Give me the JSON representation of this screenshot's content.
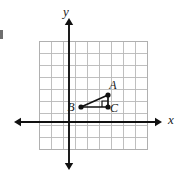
{
  "figure": {
    "background_color": "#ffffff",
    "width": 188,
    "height": 179
  },
  "axes": {
    "x_label": "x",
    "y_label": "y",
    "axis_color": "#111111",
    "origin_px": {
      "x": 69,
      "y": 122
    },
    "x_axis_span_px": {
      "from": 14,
      "to": 162
    },
    "y_axis_span_px": {
      "from": 18,
      "to": 170
    },
    "arrowheads": [
      "left",
      "right",
      "up",
      "down"
    ]
  },
  "grid": {
    "line_color": "#b8b8b8",
    "border_color": "#b0b0b0",
    "cell_size_px": 12.1,
    "left_px": 39,
    "top_px": 41,
    "columns": 9,
    "rows": 9,
    "visible": true
  },
  "triangle": {
    "name": "ABC",
    "stroke_color": "#111111",
    "right_angle_at": "C",
    "vertices": [
      {
        "label": "A",
        "px": {
          "x": 108.0,
          "y": 95.0
        },
        "grid": {
          "x": 3.2,
          "y": 2.2
        },
        "label_px": {
          "x": 113,
          "y": 89
        }
      },
      {
        "label": "B",
        "px": {
          "x": 81.0,
          "y": 107.0
        },
        "grid": {
          "x": 1.0,
          "y": 1.2
        },
        "label_px": {
          "x": 71,
          "y": 111
        }
      },
      {
        "label": "C",
        "px": {
          "x": 108.0,
          "y": 107.0
        },
        "grid": {
          "x": 3.2,
          "y": 1.2
        },
        "label_px": {
          "x": 114,
          "y": 112
        }
      }
    ],
    "sides": [
      {
        "name": "AB",
        "from": "A",
        "to": "B"
      },
      {
        "name": "BC",
        "from": "B",
        "to": "C"
      },
      {
        "name": "CA",
        "from": "C",
        "to": "A"
      }
    ],
    "right_angle_marker": {
      "at": "C",
      "size_px": 6,
      "orientation": "upper-left"
    }
  },
  "artifacts": {
    "left_edge_mark": {
      "px": {
        "x": 0,
        "y": 30
      },
      "width": 3,
      "height": 9
    }
  }
}
